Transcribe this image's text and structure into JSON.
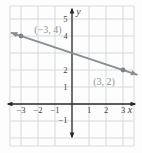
{
  "chart_data": {
    "type": "line",
    "title": "",
    "points": [
      {
        "x": -3,
        "y": 4,
        "label": "(−3, 4)"
      },
      {
        "x": 3,
        "y": 2,
        "label": "(3, 2)"
      }
    ],
    "line": {
      "slope": -0.3333,
      "intercept": 3,
      "x_start": -3.6,
      "x_end": 3.85,
      "arrows_both_ends": true
    },
    "axes": {
      "xlabel": "x",
      "ylabel": "y",
      "x_ticks": [
        -3,
        -2,
        -1,
        1,
        2,
        3
      ],
      "y_ticks": [
        5,
        4,
        2,
        1,
        -1
      ],
      "x_range": [
        -3.65,
        3.65
      ],
      "y_range": [
        -2.45,
        5.75
      ],
      "arrows_both_ends": true
    },
    "grid": true,
    "colors": {
      "background": "#fdfdfd",
      "grid": "#d5dadd",
      "axis": "#262626",
      "tick_label": "#414141",
      "line": "#878d91",
      "point": "#7d8388",
      "point_label": "#90969a"
    }
  }
}
